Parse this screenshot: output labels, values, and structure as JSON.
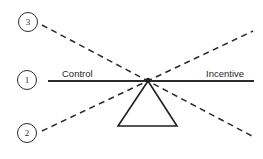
{
  "diagram": {
    "type": "seesaw-lever-balance",
    "background_color": "#ffffff",
    "stroke_color": "#2b2b2b",
    "beam": {
      "left_label": "Control",
      "right_label": "Incentive",
      "x1": 48,
      "y1": 81,
      "x2": 254,
      "y2": 81,
      "stroke_width": 2.2
    },
    "fulcrum": {
      "shape": "triangle",
      "apex_x": 148,
      "apex_y": 81,
      "base_left_x": 118,
      "base_right_x": 177,
      "base_y": 126,
      "stroke_width": 1.6
    },
    "pivot": {
      "x": 148,
      "y": 80
    },
    "dashed_lines": [
      {
        "name": "line-3",
        "from_x": 42,
        "from_y": 25,
        "to_x": 252,
        "to_y": 136,
        "dash": "6 4.5",
        "stroke_width": 1.5
      },
      {
        "name": "line-2",
        "from_x": 42,
        "from_y": 131,
        "to_x": 253,
        "to_y": 31,
        "dash": "6 4.5",
        "stroke_width": 1.5
      }
    ],
    "markers": [
      {
        "id": "marker-3",
        "label": "3",
        "cx": 28,
        "cy": 22
      },
      {
        "id": "marker-1",
        "label": "1",
        "cx": 27,
        "cy": 80
      },
      {
        "id": "marker-2",
        "label": "2",
        "cx": 27,
        "cy": 133
      }
    ]
  }
}
